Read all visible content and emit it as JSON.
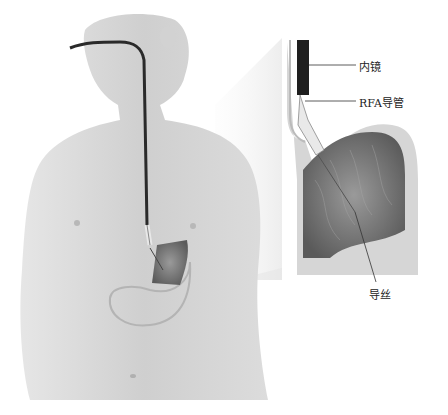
{
  "figure": {
    "labels": {
      "endoscope": "内镜",
      "rfa_catheter": "RFA导管",
      "guidewire": "导丝"
    },
    "colors": {
      "background": "#ffffff",
      "body": "#c9c9c9",
      "stomach_inner": "#7a7a7a",
      "scope": "#2a2a2a",
      "label_text": "#222222"
    }
  }
}
